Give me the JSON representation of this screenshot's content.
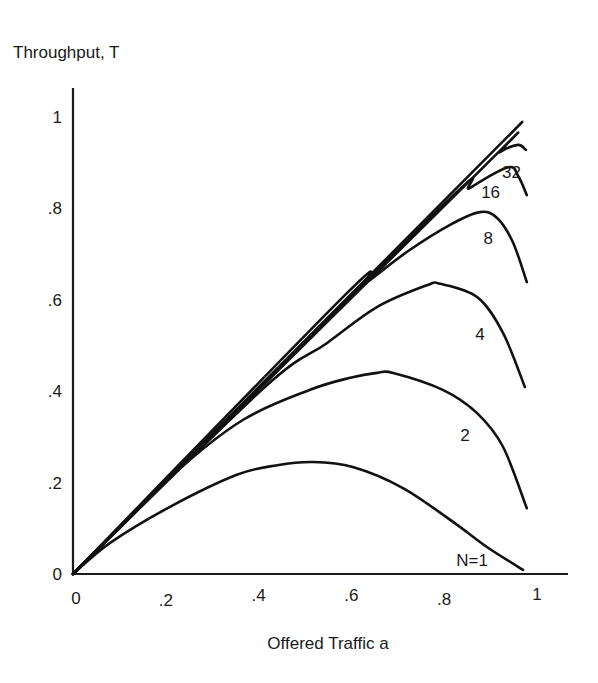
{
  "chart_data": {
    "type": "line",
    "title": "",
    "xlabel": "Offered Traffic a",
    "ylabel": "Throughput, T",
    "xlim": [
      0,
      1.05
    ],
    "ylim": [
      0,
      1.0
    ],
    "grid": false,
    "legend": "inline labels near curve ends",
    "x_ticks": [
      {
        "value": 0,
        "label": "0"
      },
      {
        "value": 0.2,
        "label": ".2"
      },
      {
        "value": 0.4,
        "label": ".4"
      },
      {
        "value": 0.6,
        "label": ".6"
      },
      {
        "value": 0.8,
        "label": ".8"
      },
      {
        "value": 1.0,
        "label": "1"
      }
    ],
    "y_ticks": [
      {
        "value": 0,
        "label": "0"
      },
      {
        "value": 0.2,
        "label": ".2"
      },
      {
        "value": 0.4,
        "label": ".4"
      },
      {
        "value": 0.6,
        "label": ".6"
      },
      {
        "value": 0.8,
        "label": ".8"
      },
      {
        "value": 1.0,
        "label": "1"
      }
    ],
    "series": [
      {
        "name": "T = a (ideal)",
        "label": "",
        "x": [
          0,
          0.968
        ],
        "y": [
          0,
          0.989
        ]
      },
      {
        "name": "N=1",
        "label": "N=1",
        "label_pos": [
          0.86,
          0.03
        ],
        "x": [
          0,
          0.08,
          0.209,
          0.353,
          0.44,
          0.517,
          0.603,
          0.711,
          0.819,
          0.892,
          0.97
        ],
        "y": [
          0,
          0.068,
          0.147,
          0.217,
          0.238,
          0.245,
          0.234,
          0.188,
          0.114,
          0.059,
          0.009
        ]
      },
      {
        "name": "N=2",
        "label": "2",
        "label_pos": [
          0.845,
          0.305
        ],
        "x": [
          0,
          0.22,
          0.366,
          0.511,
          0.6,
          0.655,
          0.69,
          0.797,
          0.871,
          0.927,
          0.978
        ],
        "y": [
          0,
          0.221,
          0.337,
          0.403,
          0.43,
          0.44,
          0.44,
          0.403,
          0.352,
          0.278,
          0.144
        ]
      },
      {
        "name": "N=4",
        "label": "4",
        "label_pos": [
          0.877,
          0.525
        ],
        "x": [
          0,
          0.407,
          0.547,
          0.655,
          0.763,
          0.791,
          0.871,
          0.927,
          0.974
        ],
        "y": [
          0,
          0.403,
          0.505,
          0.584,
          0.632,
          0.635,
          0.606,
          0.527,
          0.409
        ]
      },
      {
        "name": "N=8",
        "label": "8",
        "label_pos": [
          0.895,
          0.735
        ],
        "x": [
          0,
          0.586,
          0.634,
          0.72,
          0.8125,
          0.877,
          0.914,
          0.948,
          0.978
        ],
        "y": [
          0,
          0.61,
          0.639,
          0.705,
          0.764,
          0.792,
          0.779,
          0.726,
          0.639
        ]
      },
      {
        "name": "N=16",
        "label": "16",
        "label_pos": [
          0.9,
          0.835
        ],
        "x": [
          0,
          0.78,
          0.856,
          0.9375,
          0.96,
          0.978
        ],
        "y": [
          0,
          0.79,
          0.845,
          0.89,
          0.87,
          0.829
        ]
      },
      {
        "name": "N=32",
        "label": "32",
        "label_pos": [
          0.945,
          0.88
        ],
        "x": [
          0,
          0.884,
          0.92,
          0.959,
          0.976
        ],
        "y": [
          0,
          0.89,
          0.923,
          0.939,
          0.928
        ]
      }
    ]
  },
  "labels": {
    "y_axis_title": "Throughput, T",
    "x_axis_title": "Offered Traffic a"
  }
}
